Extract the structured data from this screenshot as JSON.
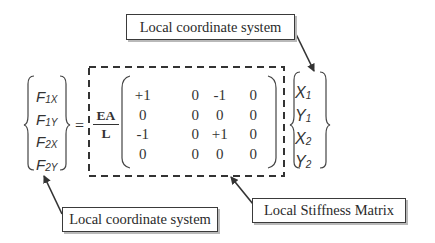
{
  "diagram": {
    "type": "matrix-equation",
    "labels": {
      "top": "Local coordinate system",
      "bottom_left": "Local coordinate system",
      "bottom_right": "Local Stiffness Matrix"
    },
    "force_vector": [
      {
        "symbol": "F",
        "subscript": "1X"
      },
      {
        "symbol": "F",
        "subscript": "1Y"
      },
      {
        "symbol": "F",
        "subscript": "2X"
      },
      {
        "symbol": "F",
        "subscript": "2Y"
      }
    ],
    "equals": "=",
    "coefficient": {
      "numerator": "EA",
      "denominator": "L"
    },
    "matrix": [
      [
        "+1",
        "0",
        "-1",
        "0"
      ],
      [
        "0",
        "0",
        "0",
        "0"
      ],
      [
        "-1",
        "0",
        "+1",
        "0"
      ],
      [
        "0",
        "0",
        "0",
        "0"
      ]
    ],
    "displacement_vector": [
      {
        "symbol": "X",
        "subscript": "1"
      },
      {
        "symbol": "Y",
        "subscript": "1"
      },
      {
        "symbol": "X",
        "subscript": "2"
      },
      {
        "symbol": "Y",
        "subscript": "2"
      }
    ],
    "colors": {
      "ink": "#333333",
      "shadow": "#b9b9b9",
      "background": "#ffffff"
    }
  }
}
